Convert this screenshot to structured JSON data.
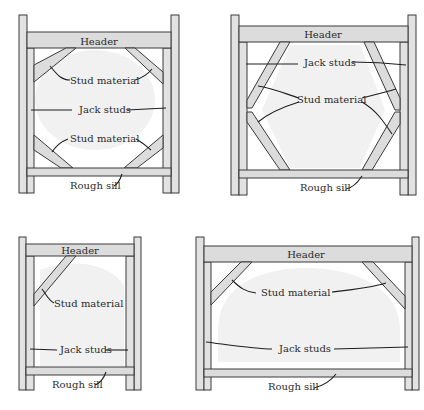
{
  "figure": {
    "panels": [
      {
        "id": "top-left",
        "title": "Octagon-shaped opening",
        "labels": {
          "header": "Header",
          "stud_material_top": "Stud material",
          "jack_studs": "Jack studs",
          "stud_material_bottom": "Stud material",
          "rough_sill": "Rough sill"
        }
      },
      {
        "id": "top-right",
        "title": "Hexagon-shaped opening",
        "labels": {
          "header": "Header",
          "jack_studs": "Jack studs",
          "stud_material": "Stud material",
          "rough_sill": "Rough sill"
        }
      },
      {
        "id": "bottom-left",
        "title": "Quarter-round opening",
        "labels": {
          "header": "Header",
          "stud_material": "Stud material",
          "jack_studs": "Jack studs",
          "rough_sill": "Rough sill"
        }
      },
      {
        "id": "bottom-right",
        "title": "Half-round opening",
        "labels": {
          "header": "Header",
          "stud_material": "Stud material",
          "jack_studs": "Jack studs",
          "rough_sill": "Rough sill"
        }
      }
    ]
  },
  "colors": {
    "lumber_fill": "#dcdcdc",
    "outline": "#3a3a3a",
    "opening_fill": "#f1f1f1",
    "background": "#ffffff"
  }
}
